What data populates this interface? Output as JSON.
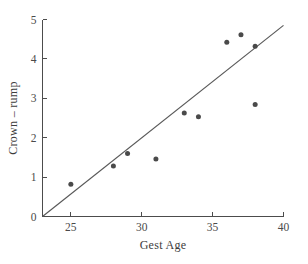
{
  "chart_data": {
    "type": "scatter",
    "title": "",
    "xlabel": "Gest Age",
    "ylabel": "Crown – rump",
    "xlim": [
      23,
      40
    ],
    "ylim": [
      0,
      5
    ],
    "xticks": [
      25,
      30,
      35,
      40
    ],
    "yticks": [
      0,
      1,
      2,
      3,
      4,
      5
    ],
    "xtick_labels": [
      "25",
      "30",
      "35",
      "40"
    ],
    "ytick_labels": [
      "0",
      "1",
      "2",
      "3",
      "4",
      "5"
    ],
    "grid": false,
    "legend": null,
    "point_color": "#4a4a4a",
    "line_color": "#585858",
    "axis_color": "#4c4c4c",
    "x": [
      25,
      28,
      29,
      31,
      33,
      34,
      36,
      37,
      38,
      38
    ],
    "y": [
      0.82,
      1.28,
      1.6,
      1.46,
      2.63,
      2.53,
      4.42,
      4.61,
      4.32,
      2.84
    ],
    "series": [
      {
        "name": "observations",
        "points": [
          {
            "x": 25,
            "y": 0.82
          },
          {
            "x": 28,
            "y": 1.28
          },
          {
            "x": 29,
            "y": 1.6
          },
          {
            "x": 31,
            "y": 1.46
          },
          {
            "x": 33,
            "y": 2.63
          },
          {
            "x": 34,
            "y": 2.53
          },
          {
            "x": 36,
            "y": 4.42
          },
          {
            "x": 37,
            "y": 4.61
          },
          {
            "x": 38,
            "y": 4.32
          },
          {
            "x": 38,
            "y": 2.84
          }
        ]
      }
    ],
    "fit_line": {
      "name": "regression-line",
      "x_start": 23.0,
      "y_start": 0.0,
      "x_end": 40.0,
      "y_end": 4.85
    }
  }
}
